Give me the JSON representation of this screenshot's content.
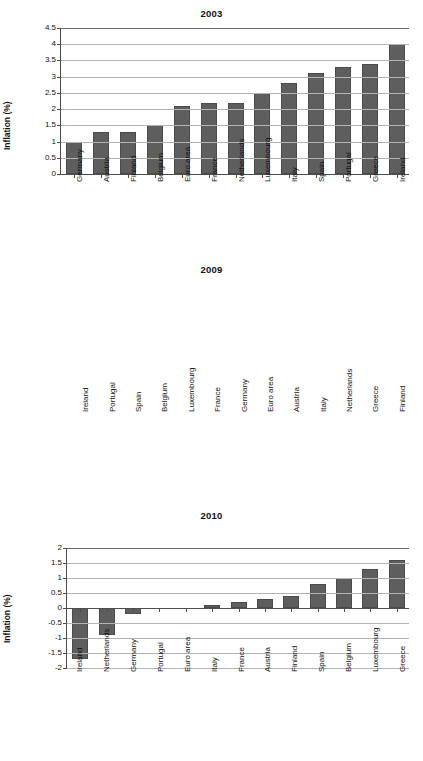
{
  "figure": {
    "ylabel": "Inflation (%)",
    "bar_color": "#5e5e5e",
    "axis_color": "#4d4d4d",
    "grid_color": "#b3b3b3"
  },
  "chart_data": [
    {
      "type": "bar",
      "title": "2003",
      "xlabel": "",
      "ylabel": "Inflation (%)",
      "ylim": [
        0,
        4.5
      ],
      "yticks": [
        "0",
        "0.5",
        "1",
        "1.5",
        "2",
        "2.5",
        "3",
        "3.5",
        "4",
        "4.5"
      ],
      "ytick_values": [
        0,
        0.5,
        1,
        1.5,
        2,
        2.5,
        3,
        3.5,
        4,
        4.5
      ],
      "grid": true,
      "legend": "none",
      "categories": [
        "Germany",
        "Austria",
        "Finland",
        "Belgium",
        "Euro area",
        "France",
        "Netherlands",
        "Luxembourg",
        "Italy",
        "Spain",
        "Portugal",
        "Greece",
        "Ireland"
      ],
      "values": [
        1.0,
        1.3,
        1.3,
        1.5,
        2.1,
        2.2,
        2.2,
        2.5,
        2.8,
        3.1,
        3.3,
        3.4,
        4.0
      ]
    },
    {
      "type": "bar",
      "title": "2009",
      "xlabel": "",
      "ylabel": "Inflation (%)",
      "ylim": [
        -2,
        2
      ],
      "yticks": [
        "-2",
        "-1.5",
        "-1",
        "-0.5",
        "0",
        "0.5",
        "1",
        "1.5",
        "2"
      ],
      "ytick_values": [
        -2,
        -1.5,
        -1,
        -0.5,
        0,
        0.5,
        1,
        1.5,
        2
      ],
      "grid": true,
      "legend": "none",
      "categories": [
        "Ireland",
        "Portugal",
        "Spain",
        "Belgium",
        "Luxembourg",
        "France",
        "Germany",
        "Euro area",
        "Austria",
        "Italy",
        "Netherlands",
        "Greece",
        "Finland"
      ],
      "values": [
        -1.7,
        -0.9,
        -0.2,
        0.0,
        0.0,
        0.1,
        0.2,
        0.3,
        0.4,
        0.8,
        1.0,
        1.3,
        1.6
      ]
    },
    {
      "type": "bar",
      "title": "2010",
      "xlabel": "",
      "ylabel": "Inflation (%)",
      "ylim": [
        -2,
        6
      ],
      "yticks": [
        "-2",
        "-1",
        "0",
        "1",
        "2",
        "3",
        "4",
        "5",
        "6"
      ],
      "ytick_values": [
        -2,
        -1,
        0,
        1,
        2,
        3,
        4,
        5,
        6
      ],
      "grid": true,
      "legend": "none",
      "categories": [
        "Ireland",
        "Netherlands",
        "Germany",
        "Portugal",
        "Euro area",
        "Italy",
        "France",
        "Austria",
        "Finland",
        "Spain",
        "Belgium",
        "Luxembourg",
        "Greece"
      ],
      "values": [
        -1.6,
        0.9,
        1.1,
        1.35,
        1.55,
        1.55,
        1.65,
        1.65,
        1.65,
        2.0,
        2.3,
        2.8,
        4.65
      ]
    }
  ]
}
